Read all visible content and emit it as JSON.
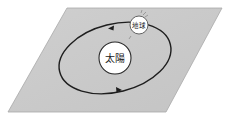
{
  "diagram": {
    "plane": {
      "fill": "#c8c8c8",
      "stroke": "#999999"
    },
    "sun": {
      "label": "太陽",
      "fill": "#ffffff",
      "stroke": "#333333"
    },
    "earth": {
      "label": "地球",
      "fill": "#ffffff",
      "stroke": "#555555"
    },
    "orbit": {
      "stroke": "#222222",
      "direction": "counterclockwise"
    }
  }
}
